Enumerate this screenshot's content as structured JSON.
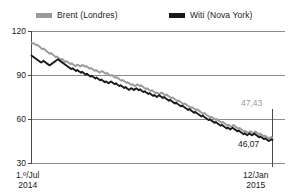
{
  "legend": {
    "items": [
      {
        "label": "Brent (Londres)",
        "color": "#9a9a9a",
        "icon": "legend-swatch-icon"
      },
      {
        "label": "Witi (Nova York)",
        "color": "#1a1a1a",
        "icon": "legend-swatch-icon"
      }
    ]
  },
  "axis": {
    "y_ticks": [
      "120",
      "90",
      "60",
      "30"
    ],
    "x_left_line1": "1.º/Jul",
    "x_left_line2": "2014",
    "x_right_line1": "12/Jan",
    "x_right_line2": "2015"
  },
  "annotations": {
    "brent_end": "47,43",
    "wti_end": "46,07"
  },
  "chart_data": {
    "type": "line",
    "title": "",
    "subtitle": "",
    "xlabel": "",
    "ylabel": "",
    "ylim": [
      30,
      120
    ],
    "xlim": [
      "1.º/Jul 2014",
      "12/Jan 2015"
    ],
    "grid": true,
    "legend_position": "top",
    "y_ticks": [
      120,
      90,
      60,
      30
    ],
    "x_tick_labels": [
      "1.º/Jul 2014",
      "12/Jan 2015"
    ],
    "annotations": [
      {
        "series": "Brent (Londres)",
        "text": "47,43",
        "value": 47.43,
        "at": "end"
      },
      {
        "series": "Witi (Nova York)",
        "text": "46,07",
        "value": 46.07,
        "at": "end"
      }
    ],
    "series": [
      {
        "name": "Brent (Londres)",
        "color": "#9a9a9a",
        "values": [
          112.4,
          111.8,
          112.0,
          111.2,
          110.6,
          110.9,
          110.1,
          109.4,
          108.6,
          107.9,
          108.4,
          107.6,
          106.8,
          106.2,
          105.4,
          104.8,
          105.3,
          104.6,
          103.9,
          103.2,
          102.5,
          102.9,
          102.1,
          101.4,
          100.8,
          101.3,
          100.6,
          99.9,
          99.2,
          99.7,
          99.0,
          98.4,
          97.8,
          98.3,
          97.6,
          97.0,
          96.4,
          96.9,
          97.4,
          96.8,
          96.2,
          96.7,
          97.2,
          96.6,
          96.0,
          96.4,
          95.8,
          95.2,
          94.6,
          95.1,
          94.4,
          93.8,
          93.2,
          93.7,
          93.1,
          92.5,
          92.0,
          92.6,
          93.1,
          92.4,
          91.8,
          91.2,
          91.7,
          91.0,
          90.4,
          89.8,
          90.3,
          89.6,
          89.0,
          88.4,
          88.9,
          88.2,
          87.6,
          87.0,
          86.4,
          86.9,
          86.2,
          85.6,
          85.0,
          85.5,
          84.8,
          84.2,
          83.6,
          84.1,
          83.4,
          82.8,
          83.3,
          84.0,
          83.4,
          82.8,
          83.3,
          82.6,
          82.0,
          81.4,
          80.8,
          81.3,
          80.6,
          80.0,
          79.4,
          79.9,
          79.2,
          78.6,
          78.0,
          78.5,
          77.8,
          77.2,
          77.8,
          78.4,
          77.7,
          77.1,
          76.5,
          77.0,
          76.3,
          75.7,
          75.1,
          74.5,
          75.0,
          74.3,
          73.7,
          73.1,
          72.5,
          73.0,
          72.3,
          71.7,
          71.1,
          70.5,
          71.0,
          70.3,
          69.7,
          69.1,
          68.5,
          67.9,
          68.4,
          67.7,
          67.1,
          66.5,
          67.0,
          66.3,
          65.7,
          65.1,
          64.5,
          63.9,
          64.4,
          63.7,
          63.1,
          62.5,
          61.9,
          61.3,
          61.8,
          61.1,
          60.5,
          59.9,
          60.4,
          59.7,
          59.1,
          58.5,
          57.9,
          58.4,
          57.7,
          57.1,
          56.5,
          55.9,
          56.4,
          55.7,
          55.1,
          55.6,
          56.2,
          55.5,
          54.9,
          54.3,
          53.7,
          54.2,
          53.5,
          52.9,
          52.3,
          51.7,
          52.2,
          51.5,
          50.9,
          51.4,
          52.0,
          51.3,
          50.7,
          51.2,
          51.8,
          51.1,
          50.5,
          49.9,
          50.4,
          49.7,
          49.1,
          48.5,
          49.0,
          48.3,
          47.7,
          47.1,
          47.6,
          48.1,
          47.43
        ]
      },
      {
        "name": "Witi (Nova York)",
        "color": "#1a1a1a",
        "values": [
          103.6,
          103.0,
          102.4,
          101.8,
          101.2,
          100.6,
          100.0,
          99.4,
          98.8,
          99.4,
          100.0,
          99.3,
          98.7,
          98.1,
          97.5,
          96.9,
          97.5,
          98.1,
          98.7,
          99.3,
          99.9,
          100.5,
          101.1,
          100.4,
          99.8,
          99.2,
          98.6,
          98.0,
          97.4,
          96.8,
          96.2,
          95.6,
          95.0,
          94.4,
          95.0,
          94.3,
          93.7,
          93.1,
          93.7,
          93.1,
          92.5,
          91.9,
          92.5,
          91.8,
          91.2,
          90.6,
          91.2,
          90.5,
          89.9,
          89.3,
          89.9,
          89.2,
          88.6,
          88.0,
          88.6,
          87.9,
          87.3,
          86.7,
          87.3,
          86.6,
          86.0,
          85.4,
          86.0,
          85.3,
          84.7,
          85.3,
          86.0,
          85.3,
          84.7,
          84.1,
          84.7,
          84.0,
          83.4,
          82.8,
          83.4,
          82.7,
          82.1,
          81.5,
          82.1,
          81.4,
          80.8,
          80.2,
          80.8,
          81.4,
          80.7,
          80.1,
          80.7,
          81.3,
          80.6,
          80.0,
          80.6,
          79.9,
          79.3,
          78.7,
          79.3,
          78.6,
          78.0,
          77.4,
          78.0,
          77.3,
          76.7,
          76.1,
          76.7,
          76.0,
          75.4,
          76.0,
          76.6,
          75.9,
          75.3,
          74.7,
          75.3,
          74.6,
          74.0,
          73.4,
          72.8,
          73.4,
          72.7,
          72.1,
          71.5,
          70.9,
          71.5,
          70.8,
          70.2,
          69.6,
          69.0,
          69.6,
          68.9,
          68.3,
          67.7,
          67.1,
          66.5,
          67.1,
          66.4,
          65.8,
          65.2,
          64.6,
          65.2,
          64.5,
          63.9,
          63.3,
          62.7,
          62.1,
          62.7,
          62.0,
          61.4,
          60.8,
          60.2,
          59.6,
          60.2,
          59.5,
          58.9,
          58.3,
          57.7,
          58.3,
          57.6,
          57.0,
          56.4,
          55.8,
          56.4,
          55.7,
          55.1,
          54.5,
          53.9,
          54.5,
          53.8,
          53.2,
          53.8,
          54.4,
          53.7,
          53.1,
          52.5,
          51.9,
          52.5,
          51.8,
          51.2,
          50.6,
          50.0,
          50.6,
          49.9,
          49.3,
          49.9,
          50.5,
          49.8,
          49.2,
          49.8,
          50.4,
          49.7,
          49.1,
          48.5,
          47.9,
          48.5,
          47.8,
          47.2,
          46.6,
          47.2,
          46.5,
          45.9,
          45.3,
          45.9,
          46.5,
          46.07
        ]
      }
    ]
  }
}
